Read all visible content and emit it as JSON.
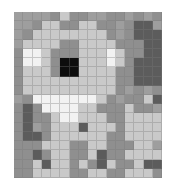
{
  "artwork": {
    "title": "Grayscale Pixel Mosaic Of A Dog",
    "medium": "pixel-art mosaic",
    "grid_columns": 16,
    "grid_rows": 18,
    "background_color": "#ffffff",
    "grid_line_color": "#787878",
    "subject": "dog"
  },
  "palette": {
    "K": "#0d0d0d",
    "D": "#5c5c5c",
    "M": "#8f8f8f",
    "G": "#9e9e9e",
    "L": "#c9c9c9",
    "P": "#dcdcdc",
    "W": "#f2f2f2"
  },
  "legend": [
    {
      "key": "K",
      "name": "black",
      "hex": "#0d0d0d"
    },
    {
      "key": "D",
      "name": "dark-gray",
      "hex": "#5c5c5c"
    },
    {
      "key": "M",
      "name": "mid-gray",
      "hex": "#8f8f8f"
    },
    {
      "key": "G",
      "name": "gray",
      "hex": "#9e9e9e"
    },
    {
      "key": "L",
      "name": "light-gray",
      "hex": "#c9c9c9"
    },
    {
      "key": "P",
      "name": "pale-gray",
      "hex": "#dcdcdc"
    },
    {
      "key": "W",
      "name": "white",
      "hex": "#f2f2f2"
    }
  ],
  "pixels": [
    "GGGGMLMMGGMMGMGM",
    "GGMLLMMLLMMGMDDG",
    "GMLLLLLLLLMGMDDD",
    "GLLLLMMLLLLMMMDD",
    "MWWLMMMLLLWLMMDD",
    "MWWLMKKLLLWLMDDD",
    "MLLLMKKLLLLMMDDD",
    "MLLLLLLLLLLMMDDD",
    "MLLLLLLLLLLMGMGM",
    "GMWWWWWWWLMGMMLD",
    "MDMWWWWLLMMMLMMG",
    "MDMMLWWLLLMMLLLL",
    "MDGMLLLDLLLMLLLL",
    "MDDMLLLLLLMMLLLL",
    "MMMLLLMMLLMMMLLG",
    "MMDMLLMMLDMMLLLL",
    "MMLDLLMLMDLMMLDD",
    "MMLLLLMMLLMMLLLM"
  ]
}
